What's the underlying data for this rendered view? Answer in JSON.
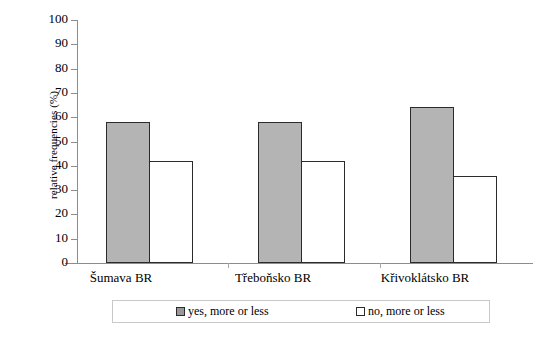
{
  "chart_data": {
    "type": "bar",
    "title": "",
    "subtitle": "",
    "xlabel": "",
    "ylabel": "relative frequencies (%)",
    "categories": [
      "Šumava BR",
      "Třeboňsko BR",
      "Křivoklátsko BR"
    ],
    "series": [
      {
        "name": "yes, more or less",
        "values": [
          58,
          58,
          64
        ],
        "color": "#b4b4b4"
      },
      {
        "name": "no, more or less",
        "values": [
          42,
          42,
          36
        ],
        "color": "#ffffff"
      }
    ],
    "ylim": [
      0,
      100
    ],
    "ytick_labels": [
      "100",
      "90",
      "80",
      "70",
      "60",
      "50",
      "40",
      "30",
      "20",
      "10",
      "0"
    ],
    "ytick_values": [
      100,
      90,
      80,
      70,
      60,
      50,
      40,
      30,
      20,
      10,
      0
    ],
    "grid": false,
    "legend_position": "bottom"
  },
  "legend": {
    "entries": [
      {
        "label": "yes, more or less",
        "swatch": "gray"
      },
      {
        "label": "no, more or less",
        "swatch": "white"
      }
    ]
  },
  "colors": {
    "bar_gray": "#b4b4b4",
    "bar_white": "#ffffff",
    "bar_outline": "#2b2b2b",
    "axis": "#8d8d8d",
    "legend_border": "#c9c9c9",
    "background": "#ffffff"
  }
}
